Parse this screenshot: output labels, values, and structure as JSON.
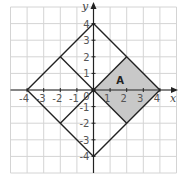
{
  "diagram": {
    "type": "coordinate-grid",
    "x_axis": {
      "label": "x",
      "ticks": [
        -4,
        -3,
        -2,
        -1,
        0,
        1,
        2,
        3,
        4
      ],
      "range": [
        -5,
        5
      ]
    },
    "y_axis": {
      "label": "y",
      "ticks": [
        -4,
        -3,
        -2,
        -1,
        1,
        2,
        3,
        4
      ],
      "range": [
        -5,
        5
      ]
    },
    "origin_label": "0",
    "x_tick_labels": [
      "-4",
      "-3",
      "-2",
      "-1",
      "1",
      "2",
      "3",
      "4"
    ],
    "y_tick_labels": [
      "4",
      "3",
      "2",
      "1",
      "-1",
      "-2",
      "-3",
      "-4"
    ],
    "outer_square": [
      [
        0,
        4
      ],
      [
        4,
        0
      ],
      [
        0,
        -4
      ],
      [
        -4,
        0
      ]
    ],
    "inner_segments": [
      [
        [
          -2,
          2
        ],
        [
          0,
          0
        ]
      ],
      [
        [
          -2,
          -2
        ],
        [
          0,
          0
        ]
      ],
      [
        [
          0,
          0
        ],
        [
          2,
          2
        ]
      ],
      [
        [
          0,
          0
        ],
        [
          2,
          -2
        ]
      ]
    ],
    "shaded_region": {
      "label": "A",
      "vertices": [
        [
          0,
          0
        ],
        [
          2,
          2
        ],
        [
          4,
          0
        ],
        [
          2,
          -2
        ]
      ],
      "fill": "#c8c8c8"
    },
    "colors": {
      "grid": "#d4d4d4",
      "axes": "#222222",
      "shapes": "#222222",
      "shade": "#c8c8c8"
    }
  }
}
